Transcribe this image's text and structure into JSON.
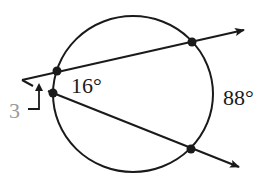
{
  "diagram": {
    "type": "circle-with-two-secants",
    "labels": {
      "inner_arc": "16°",
      "outer_arc": "88°",
      "angle_marker": "3"
    },
    "colors": {
      "stroke": "#1a1a1a",
      "marker_label": "#9a9a9a",
      "background": "#ffffff"
    },
    "elements": {
      "circle": "circle",
      "secants": [
        "upper-secant",
        "lower-secant"
      ],
      "points": [
        "upper-near-point",
        "upper-far-point",
        "lower-near-point",
        "lower-far-point"
      ]
    }
  }
}
